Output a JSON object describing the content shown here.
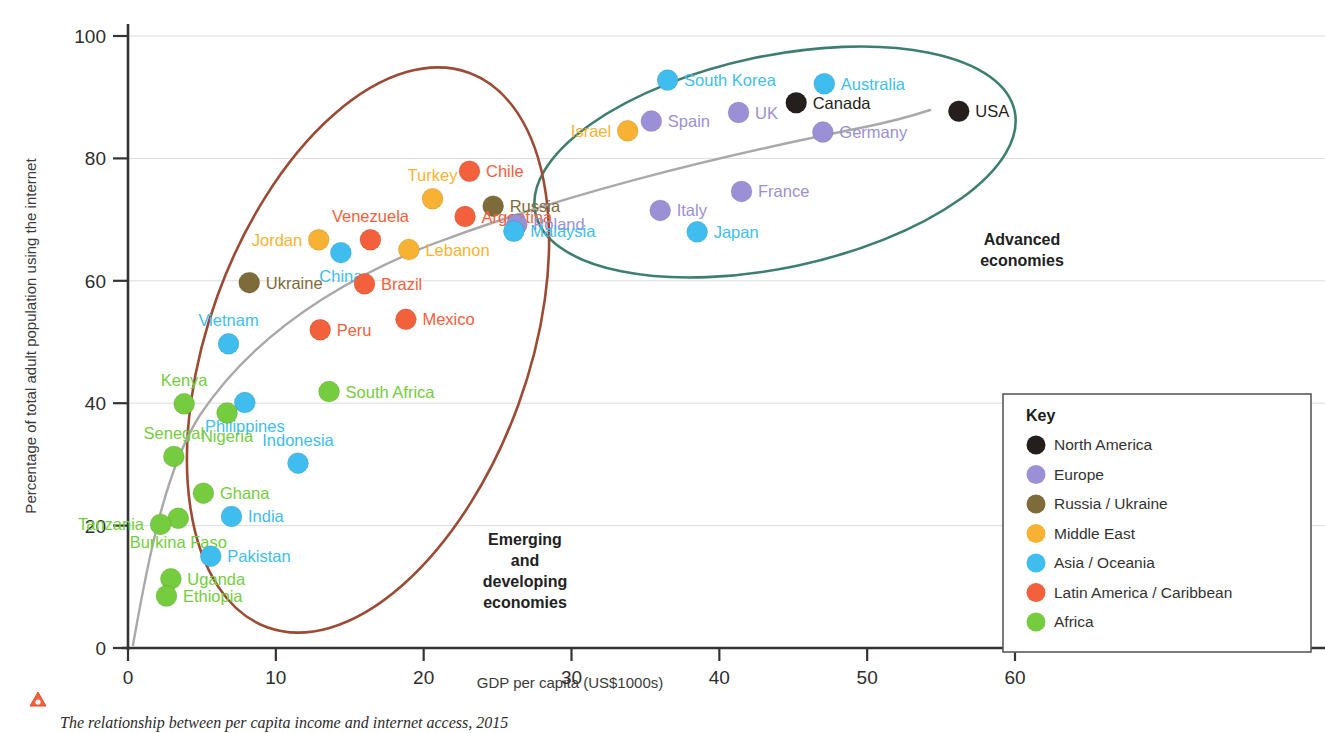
{
  "chart_data": {
    "type": "scatter",
    "title": "",
    "xlabel": "GDP per capita (US$1000s)",
    "ylabel": "Percentage of total adult population using the internet",
    "xlim": [
      0,
      60
    ],
    "ylim": [
      0,
      100
    ],
    "xticks": [
      "0",
      "10",
      "20",
      "30",
      "40",
      "50",
      "60"
    ],
    "yticks": [
      "0",
      "20",
      "40",
      "60",
      "80",
      "100"
    ],
    "grid": "horizontal",
    "legend_position": "right",
    "points": [
      {
        "name": "South Korea",
        "x": 36.5,
        "y": 92.8,
        "group": "Asia/Oceania",
        "label_side": "right"
      },
      {
        "name": "Australia",
        "x": 47.1,
        "y": 92.2,
        "group": "Asia/Oceania",
        "label_side": "right"
      },
      {
        "name": "Canada",
        "x": 45.2,
        "y": 89.1,
        "group": "North America",
        "label_side": "right"
      },
      {
        "name": "USA",
        "x": 56.2,
        "y": 87.7,
        "group": "North America",
        "label_side": "right"
      },
      {
        "name": "UK",
        "x": 41.3,
        "y": 87.5,
        "group": "Europe",
        "label_side": "right"
      },
      {
        "name": "Spain",
        "x": 35.4,
        "y": 86.1,
        "group": "Europe",
        "label_side": "right"
      },
      {
        "name": "Israel",
        "x": 33.8,
        "y": 84.5,
        "group": "Middle East",
        "label_side": "left"
      },
      {
        "name": "Germany",
        "x": 47.0,
        "y": 84.3,
        "group": "Europe",
        "label_side": "right"
      },
      {
        "name": "Chile",
        "x": 23.1,
        "y": 77.9,
        "group": "Latin America/Caribbean",
        "label_side": "right"
      },
      {
        "name": "Russia",
        "x": 24.7,
        "y": 72.2,
        "group": "Russia/Ukraine",
        "label_side": "right"
      },
      {
        "name": "France",
        "x": 41.5,
        "y": 74.6,
        "group": "Europe",
        "label_side": "right"
      },
      {
        "name": "Turkey",
        "x": 20.6,
        "y": 73.4,
        "group": "Middle East",
        "label_side": "top"
      },
      {
        "name": "Italy",
        "x": 36.0,
        "y": 71.5,
        "group": "Europe",
        "label_side": "right"
      },
      {
        "name": "Argentina",
        "x": 22.8,
        "y": 70.5,
        "group": "Latin America/Caribbean",
        "label_side": "right"
      },
      {
        "name": "Poland",
        "x": 26.3,
        "y": 69.2,
        "group": "Europe",
        "label_side": "right"
      },
      {
        "name": "Japan",
        "x": 38.5,
        "y": 68.0,
        "group": "Asia/Oceania",
        "label_side": "right"
      },
      {
        "name": "Malaysia",
        "x": 26.1,
        "y": 68.1,
        "group": "Asia/Oceania",
        "label_side": "right"
      },
      {
        "name": "Venezuela",
        "x": 16.4,
        "y": 66.7,
        "group": "Latin America/Caribbean",
        "label_side": "top"
      },
      {
        "name": "Jordan",
        "x": 12.9,
        "y": 66.7,
        "group": "Middle East",
        "label_side": "left"
      },
      {
        "name": "Lebanon",
        "x": 19.0,
        "y": 65.1,
        "group": "Middle East",
        "label_side": "right"
      },
      {
        "name": "China",
        "x": 14.4,
        "y": 64.6,
        "group": "Asia/Oceania",
        "label_side": "bottom"
      },
      {
        "name": "Ukraine",
        "x": 8.2,
        "y": 59.7,
        "group": "Russia/Ukraine",
        "label_side": "right"
      },
      {
        "name": "Brazil",
        "x": 16.0,
        "y": 59.5,
        "group": "Latin America/Caribbean",
        "label_side": "right"
      },
      {
        "name": "Mexico",
        "x": 18.8,
        "y": 53.7,
        "group": "Latin America/Caribbean",
        "label_side": "right"
      },
      {
        "name": "Peru",
        "x": 13.0,
        "y": 52.0,
        "group": "Latin America/Caribbean",
        "label_side": "right"
      },
      {
        "name": "Vietnam",
        "x": 6.8,
        "y": 49.7,
        "group": "Asia/Oceania",
        "label_side": "top"
      },
      {
        "name": "South Africa",
        "x": 13.6,
        "y": 41.9,
        "group": "Africa",
        "label_side": "right"
      },
      {
        "name": "Philippines",
        "x": 7.9,
        "y": 40.1,
        "group": "Asia/Oceania",
        "label_side": "bottom"
      },
      {
        "name": "Kenya",
        "x": 3.8,
        "y": 39.9,
        "group": "Africa",
        "label_side": "top"
      },
      {
        "name": "Nigeria",
        "x": 6.7,
        "y": 38.4,
        "group": "Africa",
        "label_side": "bottom"
      },
      {
        "name": "Senegal",
        "x": 3.1,
        "y": 31.3,
        "group": "Africa",
        "label_side": "top"
      },
      {
        "name": "Indonesia",
        "x": 11.5,
        "y": 30.2,
        "group": "Asia/Oceania",
        "label_side": "top"
      },
      {
        "name": "Ghana",
        "x": 5.1,
        "y": 25.3,
        "group": "Africa",
        "label_side": "right"
      },
      {
        "name": "India",
        "x": 7.0,
        "y": 21.5,
        "group": "Asia/Oceania",
        "label_side": "right"
      },
      {
        "name": "Burkina Faso",
        "x": 3.4,
        "y": 21.2,
        "group": "Africa",
        "label_side": "bottom"
      },
      {
        "name": "Tanzania",
        "x": 2.2,
        "y": 20.2,
        "group": "Africa",
        "label_side": "left"
      },
      {
        "name": "Pakistan",
        "x": 5.6,
        "y": 15.0,
        "group": "Asia/Oceania",
        "label_side": "right"
      },
      {
        "name": "Uganda",
        "x": 2.9,
        "y": 11.3,
        "group": "Africa",
        "label_side": "right"
      },
      {
        "name": "Ethiopia",
        "x": 2.6,
        "y": 8.5,
        "group": "Africa",
        "label_side": "right"
      }
    ],
    "clusters": [
      {
        "name": "Advanced economies",
        "label_lines": [
          "Advanced",
          "economies"
        ],
        "color": "#3d7f6e"
      },
      {
        "name": "Emerging and developing economies",
        "label_lines": [
          "Emerging",
          "and",
          "developing",
          "economies"
        ],
        "color": "#9c4a33"
      }
    ],
    "trendline": {
      "present": true,
      "color": "#a9a9a9"
    }
  },
  "legend": {
    "title": "Key",
    "items": [
      {
        "label": "North America",
        "color": "#241f1c"
      },
      {
        "label": "Europe",
        "color": "#9b8fd6"
      },
      {
        "label": "Russia / Ukraine",
        "color": "#7d6b3a"
      },
      {
        "label": "Middle East",
        "color": "#f7b233"
      },
      {
        "label": "Asia / Oceania",
        "color": "#3fbdee"
      },
      {
        "label": "Latin America / Caribbean",
        "color": "#f2603c"
      },
      {
        "label": "Africa",
        "color": "#74cc3e"
      }
    ]
  },
  "caption": {
    "text": "The relationship between per capita income and internet access, 2015",
    "marker": "warning-triangle-icon"
  },
  "group_colors": {
    "North America": "#241f1c",
    "Europe": "#9b8fd6",
    "Russia/Ukraine": "#7d6b3a",
    "Middle East": "#f7b233",
    "Asia/Oceania": "#3fbdee",
    "Latin America/Caribbean": "#f2603c",
    "Africa": "#74cc3e"
  }
}
